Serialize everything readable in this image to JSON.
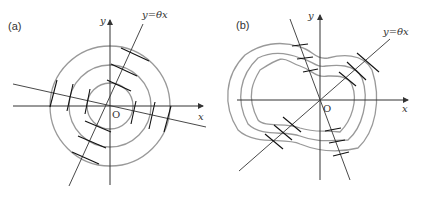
{
  "panels": [
    {
      "label": "(a)",
      "x_axis": "x",
      "y_axis": "y",
      "origin": "O",
      "line_label": "y=θx",
      "contours": "concentric circles"
    },
    {
      "label": "(b)",
      "x_axis": "x",
      "y_axis": "y",
      "origin": "O",
      "line_label": "y=θx",
      "contours": "irregular closed curves"
    }
  ],
  "colors": {
    "axis": "#333333",
    "contour": "#999999",
    "tick": "#111111"
  }
}
